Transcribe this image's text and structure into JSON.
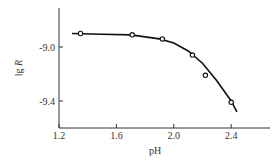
{
  "chart_data": {
    "type": "scatter",
    "title": "",
    "xlabel": "pH",
    "ylabel": "lg R",
    "xlim": [
      1.2,
      2.6
    ],
    "ylim": [
      -9.5,
      -8.7
    ],
    "x_ticks": [
      "1.2",
      "1.6",
      "2.0",
      "2.4"
    ],
    "y_ticks": [
      "-9.0",
      "-9.4"
    ],
    "grid": false,
    "legend": null,
    "series": [
      {
        "name": "measured",
        "marker": "open-circle",
        "x": [
          1.35,
          1.71,
          1.92,
          2.13,
          2.22,
          2.4
        ],
        "y": [
          -8.9,
          -8.91,
          -8.94,
          -9.06,
          -9.21,
          -9.41
        ]
      },
      {
        "name": "fitted curve",
        "style": "line",
        "x": [
          1.29,
          1.5,
          1.7,
          1.9,
          2.0,
          2.1,
          2.2,
          2.3,
          2.4,
          2.44
        ],
        "y": [
          -8.9,
          -8.905,
          -8.91,
          -8.94,
          -8.97,
          -9.03,
          -9.12,
          -9.25,
          -9.4,
          -9.48
        ]
      }
    ]
  }
}
